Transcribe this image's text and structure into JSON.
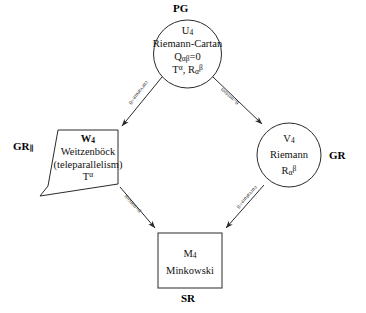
{
  "diagram": {
    "title_top_label": "PG",
    "nodes": [
      {
        "id": "u4",
        "shape": "circle",
        "lines": [
          "U4",
          "Riemann-Cartan",
          "Qαβ=0",
          "Tα, Rαβ"
        ],
        "line1": "U",
        "line1_sub": "4",
        "line2": "Riemann-Cartan",
        "line3_base": "Q",
        "line3_sub": "αβ",
        "line3_tail": "=0",
        "line4_a": "T",
        "line4_a_sup": "α",
        "line4_sep": ", ",
        "line4_b": "R",
        "line4_b_sub": "α",
        "line4_b_sup": "β",
        "outer_label": "PG",
        "outer_label_position": "top"
      },
      {
        "id": "w4",
        "shape": "quadrilateral",
        "line1": "W",
        "line1_sub": "4",
        "line2": "Weitzenböck",
        "line3": "(teleparallelism)",
        "line4": "T",
        "line4_sup": "α",
        "outer_label": "GR",
        "outer_label_sub": "∥",
        "outer_label_position": "left"
      },
      {
        "id": "v4",
        "shape": "circle",
        "line1": "V",
        "line1_sub": "4",
        "line2": "Riemann",
        "line3": "R",
        "line3_sub": "α",
        "line3_sup": "β",
        "outer_label": "GR",
        "outer_label_position": "right"
      },
      {
        "id": "m4",
        "shape": "rectangle",
        "line1": "M",
        "line1_sub": "4",
        "line2": "Minkowski",
        "outer_label": "SR",
        "outer_label_position": "bottom"
      }
    ],
    "edges": [
      {
        "id": "pg-to-w4",
        "from": "u4",
        "to": "w4",
        "label": "curvature=0"
      },
      {
        "id": "pg-to-v4",
        "from": "u4",
        "to": "v4",
        "label": "torsion=0"
      },
      {
        "id": "w4-to-m4",
        "from": "w4",
        "to": "m4",
        "label": "torsion=0"
      },
      {
        "id": "v4-to-m4",
        "from": "v4",
        "to": "m4",
        "label": "curvature=0"
      }
    ],
    "colors": {
      "stroke": "#2a2a2a",
      "text": "#111111",
      "background": "#ffffff"
    }
  }
}
